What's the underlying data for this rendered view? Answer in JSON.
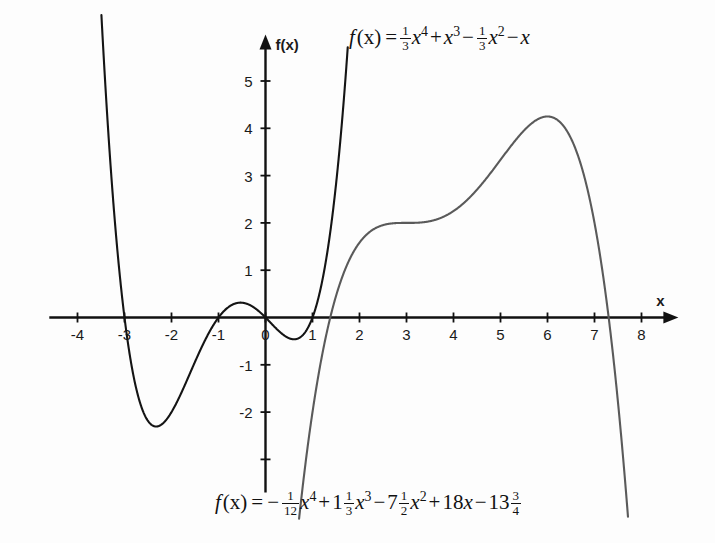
{
  "chart_data": {
    "type": "line",
    "title": "",
    "xlabel": "x",
    "ylabel": "f(x)",
    "xlim": [
      -4.6,
      8.7
    ],
    "ylim": [
      -3.7,
      5.9
    ],
    "grid": false,
    "legend": "none",
    "x_ticks": [
      -4,
      -3,
      -2,
      -1,
      0,
      1,
      2,
      3,
      4,
      5,
      6,
      7,
      8
    ],
    "x_tick_labels": [
      "-4",
      "-3",
      "-2",
      "-1",
      "0",
      "1",
      "2",
      "3",
      "4",
      "5",
      "6",
      "7",
      "8"
    ],
    "y_ticks": [
      -3,
      -2,
      -1,
      1,
      2,
      3,
      4,
      5
    ],
    "y_tick_labels": [
      "-3",
      "-2",
      "-1",
      "1",
      "2",
      "3",
      "4",
      "5"
    ],
    "y_tick_labels_shown": [
      "-2",
      "-1",
      "1",
      "2",
      "3",
      "4",
      "5"
    ],
    "series": [
      {
        "name": "quartic-black",
        "color": "#141414",
        "width": 2.1,
        "label": "f(x) = 1/3 x^4 + x^3 - 1/3 x^2 - x",
        "coefficients": [
          0.3333333333,
          1,
          -0.3333333333,
          -1,
          0
        ],
        "x_start": -3.55,
        "x_end": 1.75,
        "roots": [
          -3,
          -1,
          0,
          1
        ],
        "local_min": [
          -2.3,
          -2.3
        ],
        "local_max": [
          -0.55,
          0.26
        ],
        "local_min2": [
          0.58,
          -0.45
        ]
      },
      {
        "name": "quartic-gray",
        "color": "#5a5a5a",
        "width": 2.1,
        "label": "f(x) = -1/12 x^4 + 1 1/3 x^3 - 7 1/2 x^2 + 18x - 13 3/4",
        "coefficients": [
          -0.0833333333,
          1.3333333333,
          -7.5,
          18,
          -13.75
        ],
        "x_start": 0.62,
        "x_end": 7.72,
        "roots": [
          1.25,
          7.33
        ],
        "inflection_plateau": [
          3.0,
          2.0
        ],
        "local_max": [
          6.0,
          4.3
        ]
      }
    ],
    "annotations": [
      {
        "name": "top-formula",
        "x": 1.9,
        "y": 5.6
      },
      {
        "name": "bottom-formula",
        "x": 0.6,
        "y": -3.55
      }
    ]
  },
  "axes": {
    "x_axis_name": "x",
    "y_axis_name": "f(x)"
  },
  "top_formula": {
    "fname": "f",
    "arg": "(x)",
    "equals": "=",
    "term1_num": "1",
    "term1_den": "3",
    "term1_var": "x",
    "term1_pow": "4",
    "op2": "+",
    "term2_var": "x",
    "term2_pow": "3",
    "op3": "−",
    "term3_num": "1",
    "term3_den": "3",
    "term3_var": "x",
    "term3_pow": "2",
    "op4": "−",
    "term4_var": "x",
    "plain": "f(x) = 1/3 x⁴ + x³ − 1/3 x² − x"
  },
  "bottom_formula": {
    "fname": "f",
    "arg": "(x)",
    "equals": "=",
    "sign1": "−",
    "term1_num": "1",
    "term1_den": "12",
    "term1_var": "x",
    "term1_pow": "4",
    "op2": "+",
    "term2_whole": "1",
    "term2_num": "1",
    "term2_den": "3",
    "term2_var": "x",
    "term2_pow": "3",
    "op3": "−",
    "term3_whole": "7",
    "term3_num": "1",
    "term3_den": "2",
    "term3_var": "x",
    "term3_pow": "2",
    "op4": "+",
    "term4_coef": "18",
    "term4_var": "x",
    "op5": "−",
    "term5_whole": "13",
    "term5_num": "3",
    "term5_den": "4",
    "plain": "f(x) = − 1/12 x⁴ + 1 1/3 x³ − 7 1/2 x² + 18x − 13 3/4"
  }
}
